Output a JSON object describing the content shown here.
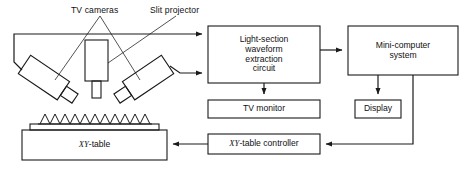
{
  "figure": {
    "type": "block-diagram",
    "line_color": "#1a1a1a",
    "background": "#ffffff"
  },
  "annotations": {
    "tv_cameras": "TV cameras",
    "slit_projector": "Slit projector"
  },
  "blocks": {
    "light_section": {
      "line1": "Light-section",
      "line2": "waveform",
      "line3": "extraction",
      "line4": "circuit"
    },
    "mini_computer": {
      "line1": "Mini-computer",
      "line2": "system"
    },
    "tv_monitor": {
      "label": "TV monitor"
    },
    "display": {
      "label": "Display"
    },
    "xy_table_controller": {
      "prefix": "XY",
      "suffix": "-table controller"
    },
    "xy_table": {
      "prefix": "XY",
      "suffix": "-table"
    }
  },
  "apparatus": {
    "left_camera": "left-tv-camera",
    "right_camera": "right-tv-camera",
    "projector": "slit-projector-body",
    "workpiece": "sawtooth-workpiece",
    "workpiece_teeth": 9
  },
  "connections": [
    {
      "from": "left-tv-camera",
      "to": "light-section-circuit"
    },
    {
      "from": "right-tv-camera",
      "to": "light-section-circuit"
    },
    {
      "from": "light-section-circuit",
      "to": "mini-computer-system"
    },
    {
      "from": "light-section-circuit",
      "to": "tv-monitor"
    },
    {
      "from": "mini-computer-system",
      "to": "display"
    },
    {
      "from": "mini-computer-system",
      "to": "xy-table-controller"
    },
    {
      "from": "xy-table-controller",
      "to": "xy-table"
    }
  ]
}
